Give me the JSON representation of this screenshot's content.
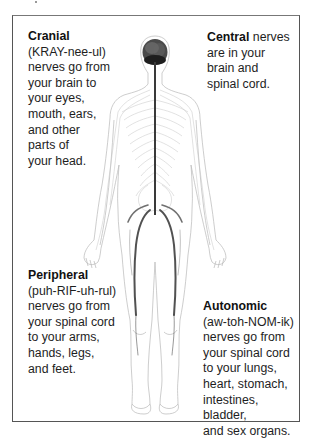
{
  "diagram": {
    "figure": "human-body-nervous-system",
    "labels": {
      "cranial": {
        "term": "Cranial",
        "pronunciation": "(KRAY-nee-ul)",
        "lines": [
          "nerves go from",
          "your brain to",
          "your eyes,",
          "mouth, ears,",
          "and other",
          "parts of",
          "your head."
        ]
      },
      "central": {
        "term": "Central",
        "first_line_rest": " nerves",
        "lines": [
          "are in your",
          "brain and",
          "spinal cord."
        ]
      },
      "peripheral": {
        "term": "Peripheral",
        "pronunciation": "(puh-RIF-uh-rul)",
        "lines": [
          "nerves go from",
          "your spinal cord",
          "to your arms,",
          "hands, legs,",
          "and feet."
        ]
      },
      "autonomic": {
        "term": "Autonomic",
        "pronunciation": "(aw-toh-NOM-ik)",
        "lines": [
          "nerves go from",
          "your spinal cord",
          "to your lungs,",
          "heart, stomach,",
          "intestines, bladder,",
          "and sex organs."
        ]
      }
    },
    "colors": {
      "border": "#555555",
      "text": "#1e1e1e",
      "outline": "#b5b5b5",
      "nerve": "#3a3a3a",
      "brain": "#2a2a2a"
    }
  }
}
